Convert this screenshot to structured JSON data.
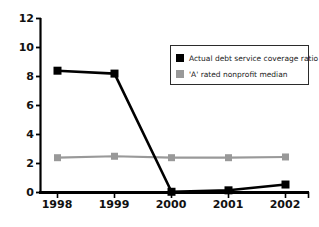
{
  "chart_data": {
    "type": "line",
    "title_visible_fragment": "",
    "xlabel": "",
    "ylabel": "",
    "categories": [
      "1998",
      "1999",
      "2000",
      "2001",
      "2002"
    ],
    "x": [
      1998,
      1999,
      2000,
      2001,
      2002
    ],
    "ylim": [
      0,
      12
    ],
    "yticks": [
      0,
      2,
      4,
      6,
      8,
      10,
      12
    ],
    "ytick_labels": [
      "0",
      "2",
      "4",
      "6",
      "8",
      "10",
      "12"
    ],
    "grid": false,
    "legend_position": "upper right",
    "markers": "square",
    "series": [
      {
        "name": "Actual debt service coverage ratio",
        "color": "#000000",
        "values": [
          8.4,
          8.2,
          0.05,
          0.15,
          0.55
        ]
      },
      {
        "name": "'A' rated nonprofit median",
        "color": "#999999",
        "values": [
          2.4,
          2.5,
          2.4,
          2.4,
          2.45
        ]
      }
    ]
  },
  "legend": {
    "entries": [
      {
        "label": "Actual debt service coverage ratio",
        "swatch_color": "#000000"
      },
      {
        "label": "'A' rated nonprofit median",
        "swatch_color": "#999999"
      }
    ]
  },
  "axes": {
    "y_labels": [
      "12",
      "10",
      "8",
      "6",
      "4",
      "2",
      "0"
    ],
    "x_labels": [
      "1998",
      "1999",
      "2000",
      "2001",
      "2002"
    ],
    "axis_color": "#000000"
  },
  "colors": {
    "background": "#ffffff",
    "series_actual": "#000000",
    "series_median": "#999999",
    "axis": "#000000",
    "text": "#111111",
    "legend_border": "#2b2b2b",
    "title_faded": "#d8d8dc"
  }
}
